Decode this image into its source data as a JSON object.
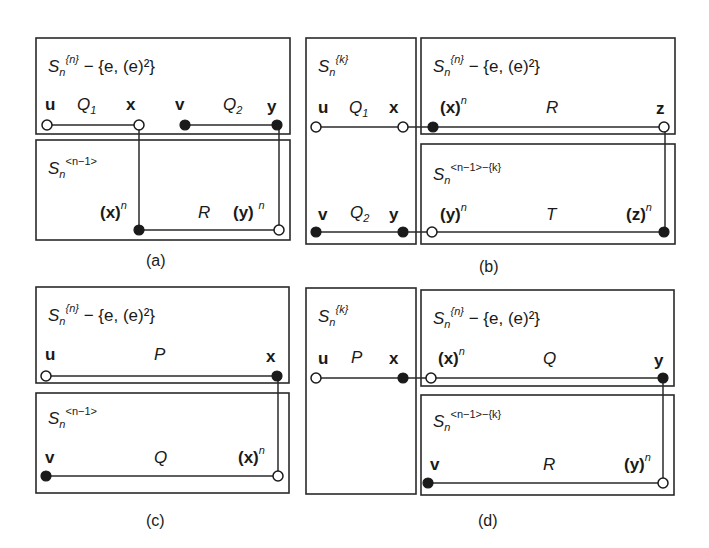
{
  "figure": {
    "panels": [
      {
        "id": "a",
        "caption": "(a)",
        "top_box": {
          "S_sup": "{n}",
          "S_sub": "n",
          "S": "S",
          "minus_set": "− {e, (e)²}"
        },
        "bottom_box": {
          "S": "S",
          "S_sub": "n",
          "S_sup": "<n−1>"
        },
        "nodes": {
          "u": "u",
          "x": "x",
          "v": "v",
          "y": "y",
          "xn": "(x)",
          "yn": "(y)",
          "n": "n"
        },
        "paths": {
          "p1": "Q",
          "p1_sub": "1",
          "p2": "Q",
          "p2_sub": "2",
          "p3": "R"
        }
      },
      {
        "id": "b",
        "caption": "(b)",
        "left_box": {
          "S": "S",
          "S_sub": "n",
          "S_sup": "{k}"
        },
        "top_box": {
          "S": "S",
          "S_sub": "n",
          "S_sup": "{n}",
          "minus_set": "− {e, (e)²}"
        },
        "bottom_box": {
          "S": "S",
          "S_sub": "n",
          "S_sup": "<n−1>−{k}"
        },
        "nodes": {
          "u": "u",
          "x": "x",
          "v": "v",
          "y": "y",
          "z": "z",
          "xn": "(x)",
          "yn": "(y)",
          "zn": "(z)",
          "n": "n"
        },
        "paths": {
          "p1": "Q",
          "p1_sub": "1",
          "p2": "Q",
          "p2_sub": "2",
          "p3": "R",
          "p4": "T"
        }
      },
      {
        "id": "c",
        "caption": "(c)",
        "top_box": {
          "S": "S",
          "S_sub": "n",
          "S_sup": "{n}",
          "minus_set": "− {e, (e)²}"
        },
        "bottom_box": {
          "S": "S",
          "S_sub": "n",
          "S_sup": "<n−1>"
        },
        "nodes": {
          "u": "u",
          "x": "x",
          "v": "v",
          "xn": "(x)",
          "n": "n"
        },
        "paths": {
          "p1": "P",
          "p2": "Q"
        }
      },
      {
        "id": "d",
        "caption": "(d)",
        "left_box": {
          "S": "S",
          "S_sub": "n",
          "S_sup": "{k}"
        },
        "top_box": {
          "S": "S",
          "S_sub": "n",
          "S_sup": "{n}",
          "minus_set": "− {e, (e)²}"
        },
        "bottom_box": {
          "S": "S",
          "S_sub": "n",
          "S_sup": "<n−1>−{k}"
        },
        "nodes": {
          "u": "u",
          "x": "x",
          "v": "v",
          "y": "y",
          "xn": "(x)",
          "yn": "(y)",
          "n": "n"
        },
        "paths": {
          "p1": "P",
          "p2": "Q",
          "p3": "R"
        }
      }
    ]
  }
}
